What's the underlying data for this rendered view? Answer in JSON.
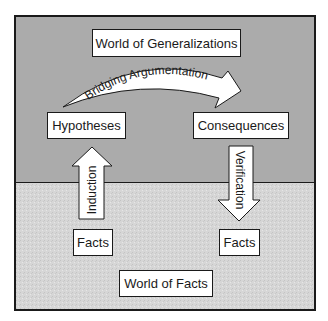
{
  "diagram": {
    "colors": {
      "upper_region": "#ababab",
      "lower_region": "#d6d6d6",
      "box_fill": "#ffffff",
      "stroke": "#1a1a1a"
    },
    "regions": {
      "upper": {
        "label": "World of Generalizations"
      },
      "lower": {
        "label": "World of Facts"
      }
    },
    "nodes": {
      "hypotheses": "Hypotheses",
      "consequences": "Consequences",
      "facts_left": "Facts",
      "facts_right": "Facts"
    },
    "arrows": {
      "bridging": "Bridging Argumentation",
      "induction": "Induction",
      "verification": "Verification"
    }
  }
}
